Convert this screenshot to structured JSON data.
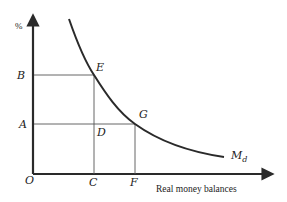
{
  "diagram": {
    "type": "money-demand-curve",
    "y_axis": {
      "label": "%"
    },
    "x_axis": {
      "label": "Real money balances"
    },
    "origin_label": "O",
    "curve": {
      "label_main": "M",
      "label_sub": "d"
    },
    "points": [
      {
        "name": "E",
        "label": "E"
      },
      {
        "name": "G",
        "label": "G"
      },
      {
        "name": "D",
        "label": "D"
      }
    ],
    "y_ticks": [
      {
        "label": "B"
      },
      {
        "label": "A"
      }
    ],
    "x_ticks": [
      {
        "label": "C"
      },
      {
        "label": "F"
      }
    ],
    "colors": {
      "line": "#2a2a2a",
      "guide": "#555555"
    }
  }
}
